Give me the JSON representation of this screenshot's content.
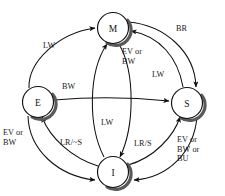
{
  "diagram": {
    "kind": "state-transition-diagram",
    "ink_color": "#111111",
    "shadow_color": "#555555",
    "background": "#ffffff",
    "states": [
      {
        "id": "M",
        "label": "M",
        "name": "Modified",
        "cx": 113,
        "cy": 28,
        "r": 15.5
      },
      {
        "id": "E",
        "label": "E",
        "name": "Exclusive",
        "cx": 38,
        "cy": 102,
        "r": 15.5
      },
      {
        "id": "S",
        "label": "S",
        "name": "Shared",
        "cx": 187,
        "cy": 103,
        "r": 15.5
      },
      {
        "id": "I",
        "label": "I",
        "name": "Invalid",
        "cx": 113,
        "cy": 172,
        "r": 15.5
      }
    ],
    "edges": [
      {
        "id": "e-m",
        "from": "E",
        "to": "M",
        "label": "LW"
      },
      {
        "id": "e-s",
        "from": "E",
        "to": "S",
        "label": "BW"
      },
      {
        "id": "e-i",
        "from": "E",
        "to": "I",
        "label": "EV or\nBW"
      },
      {
        "id": "m-s",
        "from": "M",
        "to": "S",
        "label": "BR"
      },
      {
        "id": "m-i",
        "from": "M",
        "to": "I",
        "label": "EV or\nBW"
      },
      {
        "id": "s-m",
        "from": "S",
        "to": "M",
        "label": "LW"
      },
      {
        "id": "s-i",
        "from": "S",
        "to": "I",
        "label": "EV or\nBW or\nBU"
      },
      {
        "id": "i-m",
        "from": "I",
        "to": "M",
        "label": "LW"
      },
      {
        "id": "i-s",
        "from": "I",
        "to": "S",
        "label": "LR/S"
      },
      {
        "id": "i-e",
        "from": "I",
        "to": "E",
        "label": "LR/~S"
      }
    ],
    "labels": [
      {
        "id": "lbl-lw-em",
        "text": "LW",
        "x": 43,
        "y": 41,
        "lines": 1
      },
      {
        "id": "lbl-br",
        "text": "BR",
        "x": 176,
        "y": 24,
        "lines": 1
      },
      {
        "id": "lbl-evbw-m",
        "text": "EV or\nBW",
        "x": 122,
        "y": 47,
        "lines": 2
      },
      {
        "id": "lbl-lw-s",
        "text": "LW",
        "x": 152,
        "y": 70,
        "lines": 1
      },
      {
        "id": "lbl-bw",
        "text": "BW",
        "x": 62,
        "y": 82,
        "lines": 1
      },
      {
        "id": "lbl-lw-mi",
        "text": "LW",
        "x": 101,
        "y": 118,
        "lines": 1
      },
      {
        "id": "lbl-evbw-e",
        "text": "EV or\nBW",
        "x": 3,
        "y": 128,
        "lines": 2
      },
      {
        "id": "lbl-lrns",
        "text": "LR/~S",
        "x": 60,
        "y": 138,
        "lines": 1
      },
      {
        "id": "lbl-lrs",
        "text": "LR/S",
        "x": 134,
        "y": 139,
        "lines": 1
      },
      {
        "id": "lbl-evbwbu",
        "text": "EV or\nBW or\nBU",
        "x": 177,
        "y": 135,
        "lines": 3
      }
    ]
  }
}
